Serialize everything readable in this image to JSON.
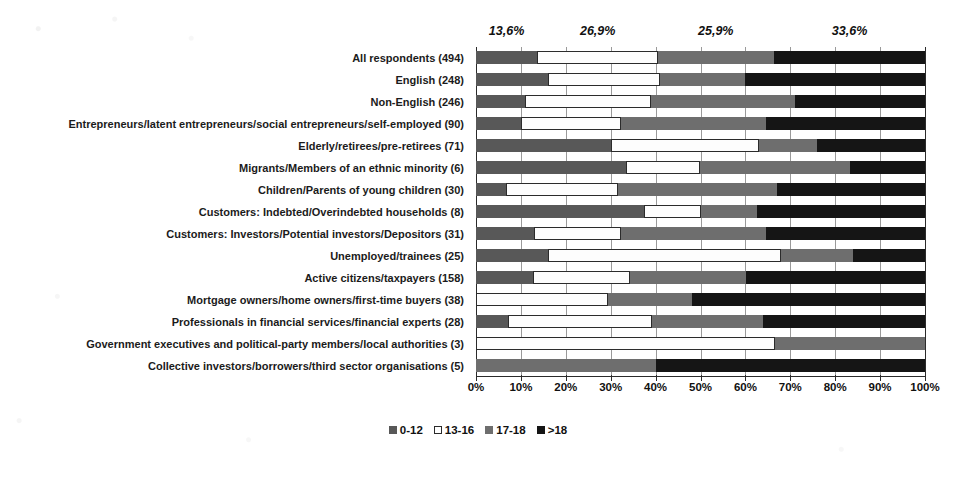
{
  "chart_data": {
    "type": "bar",
    "subtype": "stacked-horizontal-100",
    "title": "",
    "xlabel": "",
    "ylabel": "",
    "xlim": [
      0,
      100
    ],
    "grid": true,
    "legend_position": "bottom",
    "xticks": [
      "0%",
      "10%",
      "20%",
      "30%",
      "40%",
      "50%",
      "60%",
      "70%",
      "80%",
      "90%",
      "100%"
    ],
    "xtick_values": [
      0,
      10,
      20,
      30,
      40,
      50,
      60,
      70,
      80,
      90,
      100
    ],
    "legend": [
      "0-12",
      "13-16",
      "17-18",
      ">18"
    ],
    "series_colors": [
      "#585858",
      "#FFFFFF",
      "#6E6E6E",
      "#151515"
    ],
    "annotations": [
      {
        "text": "13,6%",
        "value": 13.6,
        "at_x": 6.8
      },
      {
        "text": "26,9%",
        "value": 26.9,
        "at_x": 27.1
      },
      {
        "text": "25,9%",
        "value": 25.9,
        "at_x": 53.4
      },
      {
        "text": "33,6%",
        "value": 33.6,
        "at_x": 83.2
      }
    ],
    "categories": [
      "All respondents (494)",
      "English (248)",
      "Non-English (246)",
      "Entrepreneurs/latent entrepreneurs/social entrepreneurs/self-employed (90)",
      "Elderly/retirees/pre-retirees (71)",
      "Migrants/Members of an ethnic minority (6)",
      "Children/Parents of young children (30)",
      "Customers: Indebted/Overindebted households (8)",
      "Customers: Investors/Potential investors/Depositors (31)",
      "Unemployed/trainees (25)",
      "Active citizens/taxpayers (158)",
      "Mortgage owners/home owners/first-time buyers (38)",
      "Professionals in financial services/financial experts (28)",
      "Government executives and political-party members/local authorities (3)",
      "Collective investors/borrowers/third sector organisations (5)"
    ],
    "series": [
      {
        "name": "0-12",
        "values": [
          13.6,
          16.0,
          11.0,
          10.0,
          30.0,
          33.3,
          6.7,
          37.5,
          12.9,
          16.0,
          12.7,
          0.0,
          7.1,
          0.0,
          0.0
        ]
      },
      {
        "name": "13-16",
        "values": [
          26.9,
          25.0,
          28.0,
          22.2,
          33.0,
          16.7,
          25.0,
          12.5,
          19.4,
          52.0,
          21.5,
          29.5,
          32.1,
          66.7,
          0.0
        ]
      },
      {
        "name": "17-18",
        "values": [
          25.9,
          19.0,
          32.0,
          32.3,
          13.0,
          33.3,
          35.3,
          12.5,
          32.2,
          16.0,
          25.9,
          18.5,
          24.8,
          33.3,
          40.0
        ]
      },
      {
        "name": ">18",
        "values": [
          33.6,
          40.0,
          29.0,
          35.5,
          24.0,
          16.7,
          33.0,
          37.5,
          35.5,
          16.0,
          39.9,
          52.0,
          36.0,
          0.0,
          60.0
        ]
      }
    ]
  }
}
